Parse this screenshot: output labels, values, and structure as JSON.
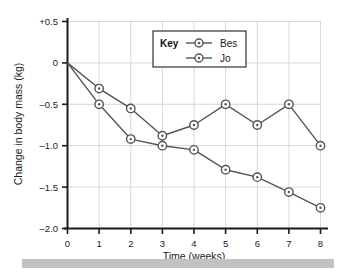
{
  "chart_data": {
    "type": "line",
    "title": "",
    "xlabel": "Time (weeks)",
    "ylabel": "Change in body mass (kg)",
    "x": [
      0,
      1,
      2,
      3,
      4,
      5,
      6,
      7,
      8
    ],
    "xlim": [
      0,
      8
    ],
    "ylim": [
      -2.0,
      0.5
    ],
    "grid": true,
    "legend_position": "top-center",
    "legend_title": "Key",
    "xtick_labels": [
      "0",
      "1",
      "2",
      "3",
      "4",
      "5",
      "6",
      "7",
      "8"
    ],
    "ytick_values": [
      0.5,
      0,
      -0.5,
      -1.0,
      -1.5,
      -2.0
    ],
    "ytick_labels": [
      "+0.5",
      "0",
      "–0.5",
      "–1.0",
      "–1.5",
      "–2.0"
    ],
    "series": [
      {
        "name": "Bes",
        "color": "#555555",
        "marker": "circle-dot",
        "values": [
          0,
          -0.31,
          -0.55,
          -0.88,
          -0.75,
          -0.5,
          -0.75,
          -0.5,
          -1.0
        ]
      },
      {
        "name": "Jo",
        "color": "#555555",
        "marker": "circle-dot",
        "values": [
          0,
          -0.5,
          -0.92,
          -1.0,
          -1.05,
          -1.29,
          -1.38,
          -1.56,
          -1.75
        ]
      }
    ]
  },
  "colors": {
    "grid": "#d8d8d8",
    "axis": "#1a1a1a",
    "line": "#555555",
    "marker_fill": "#ffffff",
    "footer_bar": "#c2c2c2",
    "legend_border": "#333333"
  },
  "footer": {
    "caption": ""
  }
}
